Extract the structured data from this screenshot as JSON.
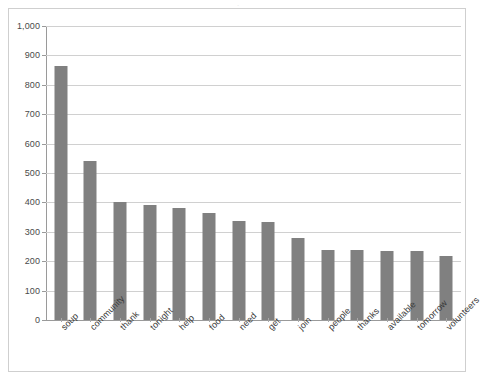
{
  "title_strip": {
    "text": "."
  },
  "chart_data": {
    "type": "bar",
    "title": "",
    "subtitle": "",
    "xlabel": "",
    "ylabel": "",
    "ylim": [
      0,
      1000
    ],
    "ytick_step": 100,
    "grid": true,
    "legend": "none",
    "bar_color": "#808080",
    "gridline_color": "#d0d0d0",
    "axis_color": "#9a9a9a",
    "categories": [
      "soup",
      "community",
      "thank",
      "tonight",
      "help",
      "food",
      "need",
      "get",
      "join",
      "people",
      "thanks",
      "available",
      "tomorrow",
      "volunteers"
    ],
    "values": [
      865,
      542,
      400,
      390,
      380,
      365,
      338,
      335,
      278,
      238,
      239,
      234,
      236,
      218
    ],
    "ytick_labels": [
      "0",
      "100",
      "200",
      "300",
      "400",
      "500",
      "600",
      "700",
      "800",
      "900",
      "1,000"
    ],
    "ytick_values": [
      0,
      100,
      200,
      300,
      400,
      500,
      600,
      700,
      800,
      900,
      1000
    ]
  }
}
